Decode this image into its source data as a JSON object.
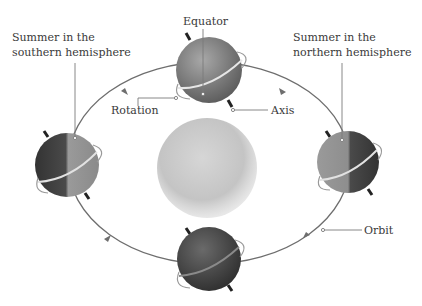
{
  "diagram": {
    "labels": {
      "equator": "Equator",
      "summer_south_line1": "Summer in the",
      "summer_south_line2": "southern hemisphere",
      "summer_north_line1": "Summer in the",
      "summer_north_line2": "northern hemisphere",
      "rotation": "Rotation",
      "axis": "Axis",
      "orbit": "Orbit"
    },
    "nodes": [
      {
        "id": "sun",
        "label": "Sun",
        "position": "center"
      },
      {
        "id": "earth-top",
        "position": "top"
      },
      {
        "id": "earth-left",
        "position": "left",
        "label": "Summer in the southern hemisphere"
      },
      {
        "id": "earth-right",
        "position": "right",
        "label": "Summer in the northern hemisphere"
      },
      {
        "id": "earth-bottom",
        "position": "bottom"
      }
    ],
    "edges": [
      {
        "from": "earth-top",
        "to": "earth-left",
        "direction": "counterclockwise"
      },
      {
        "from": "earth-left",
        "to": "earth-bottom",
        "direction": "counterclockwise"
      },
      {
        "from": "earth-bottom",
        "to": "earth-right",
        "direction": "counterclockwise"
      },
      {
        "from": "earth-right",
        "to": "earth-top",
        "direction": "counterclockwise"
      }
    ],
    "colors": {
      "orbit": "#6e6e6e",
      "sun": "#c9c9c9",
      "earth_light": "#9a9a9a",
      "earth_dark": "#3e3e3e",
      "text": "#3a3a3a",
      "leader": "#7a7a7a"
    }
  }
}
